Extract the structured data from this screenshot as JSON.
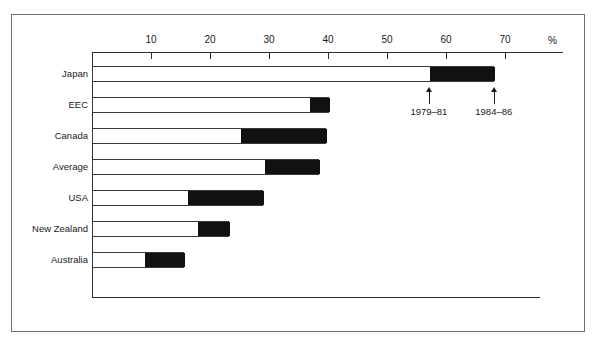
{
  "chart_data": {
    "type": "bar",
    "orientation": "horizontal",
    "title": "",
    "subtitle": "",
    "xlabel": "%",
    "ylabel": "",
    "xlim": [
      0,
      80
    ],
    "grid": false,
    "legend_position": "inline-annotation",
    "axis_unit_label": "%",
    "tick_labels": [
      "10",
      "20",
      "30",
      "40",
      "50",
      "60",
      "70"
    ],
    "ticks": [
      10,
      20,
      30,
      40,
      50,
      60,
      70
    ],
    "categories": [
      "Japan",
      "EEC",
      "Canada",
      "Average",
      "USA",
      "New Zealand",
      "Australia"
    ],
    "series": [
      {
        "name": "1979–81",
        "style": "white",
        "values": [
          57.1,
          36.8,
          25.1,
          29.2,
          16.1,
          17.8,
          8.8
        ]
      },
      {
        "name": "1984–86",
        "style": "black",
        "values": [
          68.1,
          40.2,
          39.7,
          38.5,
          29.0,
          23.2,
          15.6
        ]
      }
    ],
    "annotations": [
      {
        "label": "1979–81",
        "value": 57.1,
        "target_category": "Japan",
        "arrow": "up"
      },
      {
        "label": "1984–86",
        "value": 68.1,
        "target_category": "Japan",
        "arrow": "up"
      }
    ]
  },
  "axis": {
    "ticks": [
      {
        "label": "10",
        "value": 10
      },
      {
        "label": "20",
        "value": 20
      },
      {
        "label": "30",
        "value": 30
      },
      {
        "label": "40",
        "value": 40
      },
      {
        "label": "50",
        "value": 50
      },
      {
        "label": "60",
        "value": 60
      },
      {
        "label": "70",
        "value": 70
      }
    ],
    "unit": "%"
  },
  "rows": [
    {
      "label": "Japan",
      "start": 57.1,
      "end": 68.1
    },
    {
      "label": "EEC",
      "start": 36.8,
      "end": 40.2
    },
    {
      "label": "Canada",
      "start": 25.1,
      "end": 39.7
    },
    {
      "label": "Average",
      "start": 29.2,
      "end": 38.5
    },
    {
      "label": "USA",
      "start": 16.1,
      "end": 29.0
    },
    {
      "label": "New Zealand",
      "start": 17.8,
      "end": 23.2
    },
    {
      "label": "Australia",
      "start": 8.8,
      "end": 15.6
    }
  ],
  "annotations": [
    {
      "label": "1979–81",
      "value": 57.1
    },
    {
      "label": "1984–86",
      "value": 68.1
    }
  ],
  "colors": {
    "bar_outline": "#3a3a3a",
    "bar_fill_white": "#ffffff",
    "bar_fill_black": "#111111",
    "axis": "#2b2b2b",
    "frame": "#6e6e6e",
    "text": "#1a1a1a"
  }
}
